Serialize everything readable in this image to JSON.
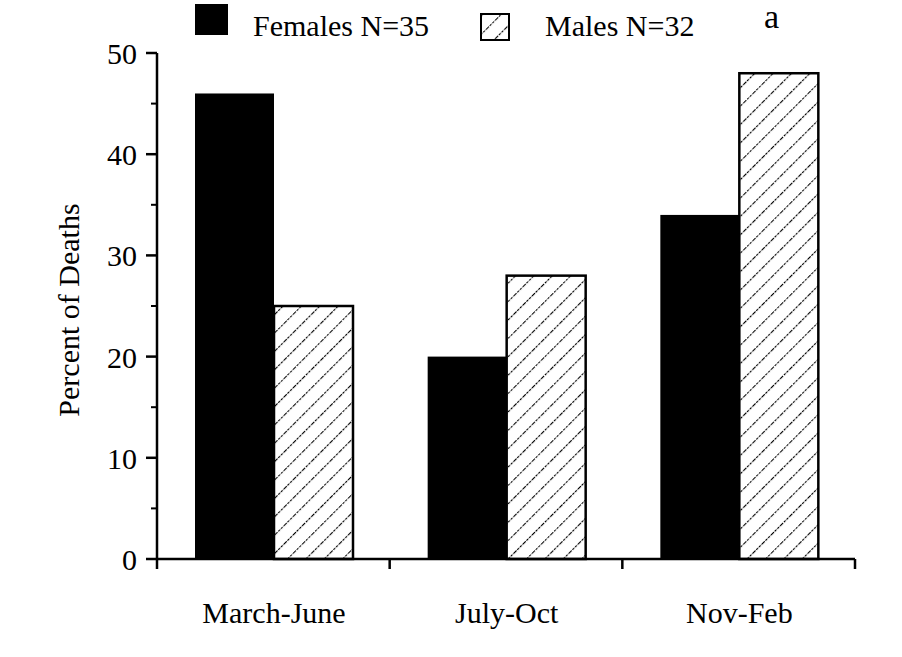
{
  "chart_data": {
    "type": "bar",
    "title": "",
    "panel_label": "a",
    "xlabel": "",
    "ylabel": "Percent of Deaths",
    "ylim": [
      0,
      50
    ],
    "yticks": [
      0,
      10,
      20,
      30,
      40,
      50
    ],
    "minor_yticks": [
      5,
      15,
      25,
      35,
      45
    ],
    "grid": false,
    "legend_position": "top",
    "categories": [
      "March-June",
      "July-Oct",
      "Nov-Feb"
    ],
    "series": [
      {
        "name": "Females N=35",
        "pattern": "solid",
        "color": "#000000",
        "values": [
          46,
          20,
          34
        ]
      },
      {
        "name": "Males N=32",
        "pattern": "diagonal-hatch",
        "color": "#ffffff",
        "values": [
          25,
          28,
          48
        ]
      }
    ]
  }
}
